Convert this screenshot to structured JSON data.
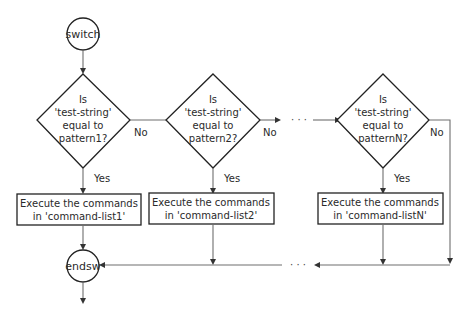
{
  "diagram": {
    "type": "flowchart",
    "start_node": {
      "label": "switch"
    },
    "end_node": {
      "label": "endsw"
    },
    "decisions": [
      {
        "lines": [
          "Is",
          "'test-string'",
          "equal to",
          "pattern1?"
        ],
        "no_label": "No",
        "yes_label": "Yes"
      },
      {
        "lines": [
          "Is",
          "'test-string'",
          "equal to",
          "pattern2?"
        ],
        "no_label": "No",
        "yes_label": "Yes"
      },
      {
        "lines": [
          "Is",
          "'test-string'",
          "equal to",
          "patternN?"
        ],
        "no_label": "No",
        "yes_label": "Yes"
      }
    ],
    "actions": [
      {
        "lines": [
          "Execute the commands",
          "in 'command-list1'"
        ]
      },
      {
        "lines": [
          "Execute the commands",
          "in 'command-list2'"
        ]
      },
      {
        "lines": [
          "Execute the commands",
          "in 'command-listN'"
        ]
      }
    ],
    "ellipsis": "· · ·"
  }
}
